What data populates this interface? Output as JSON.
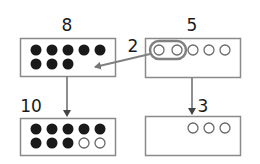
{
  "diagram": {
    "colors": {
      "box_stroke": "#8a8a8a",
      "dot_filled": "#1a1a1a",
      "dot_open_stroke": "#6a6a6a",
      "arrow": "#555555",
      "highlight_arrow": "#808080"
    },
    "boxes": [
      {
        "id": "top-left",
        "label": "8",
        "filled": 8,
        "open": 0
      },
      {
        "id": "top-right",
        "label": "5",
        "filled": 0,
        "open": 5,
        "highlighted_group": 2
      },
      {
        "id": "bottom-left",
        "label": "10",
        "filled": 8,
        "open": 2
      },
      {
        "id": "bottom-right",
        "label": "3",
        "filled": 0,
        "open": 3
      }
    ],
    "transfer_label": "2",
    "result_left_label": "10",
    "result_right_label": "3"
  }
}
